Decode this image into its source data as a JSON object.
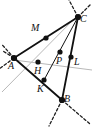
{
  "figure": {
    "type": "geometry-diagram",
    "width": 92,
    "height": 127,
    "background": "#ffffff",
    "colors": {
      "solid_line": "#111111",
      "dashed_line": "#222222",
      "auxiliary_line": "#b8b8b8",
      "point_fill": "#111111",
      "label_text": "#111111"
    },
    "points": [
      {
        "id": "A",
        "label": "A",
        "x": 14,
        "y": 58,
        "r": 3.0,
        "label_x": 10,
        "label_y": 66
      },
      {
        "id": "B",
        "label": "B",
        "x": 62,
        "y": 100,
        "r": 3.0,
        "label_x": 64,
        "label_y": 100
      },
      {
        "id": "C",
        "label": "C",
        "x": 78,
        "y": 17,
        "r": 3.0,
        "label_x": 80,
        "label_y": 19
      },
      {
        "id": "M",
        "label": "M",
        "x": 46,
        "y": 38,
        "r": 2.6,
        "label_x": 33,
        "label_y": 28
      },
      {
        "id": "H",
        "label": "H",
        "x": 38,
        "y": 62,
        "r": 2.6,
        "label_x": 37,
        "label_y": 73
      },
      {
        "id": "K",
        "label": "K",
        "x": 44,
        "y": 80,
        "r": 2.6,
        "label_x": 39,
        "label_y": 92
      },
      {
        "id": "P",
        "label": "P",
        "x": 60,
        "y": 52,
        "r": 2.6,
        "label_x": 57,
        "label_y": 63
      },
      {
        "id": "L",
        "label": "L",
        "x": 71,
        "y": 57,
        "r": 2.6,
        "label_x": 75,
        "label_y": 64
      }
    ],
    "solid_segments": [
      {
        "name": "side-AC",
        "x1": 14,
        "y1": 58,
        "x2": 78,
        "y2": 17,
        "width": 1.6
      },
      {
        "name": "side-AB",
        "x1": 14,
        "y1": 58,
        "x2": 62,
        "y2": 100,
        "width": 1.6
      },
      {
        "name": "side-CB",
        "x1": 78,
        "y1": 17,
        "x2": 62,
        "y2": 100,
        "width": 1.6
      },
      {
        "name": "cevian-C-to-K",
        "x1": 78,
        "y1": 17,
        "x2": 44,
        "y2": 80,
        "width": 1.0
      }
    ],
    "auxiliary_segments": [
      {
        "name": "aux-line-C-to-lower-left",
        "x1": 79,
        "y1": 14,
        "x2": 2,
        "y2": 92,
        "width": 1.0
      },
      {
        "name": "aux-line-A-to-right",
        "x1": 14,
        "y1": 60,
        "x2": 92,
        "y2": 70,
        "width": 1.0
      }
    ],
    "dashed_rays": [
      {
        "name": "dash-A-up-right",
        "x1": 14,
        "y1": 58,
        "x2": 2,
        "y2": 44
      },
      {
        "name": "dash-A-left-down",
        "x1": 14,
        "y1": 58,
        "x2": 1,
        "y2": 68
      },
      {
        "name": "dash-A-up-left",
        "x1": 14,
        "y1": 58,
        "x2": 4,
        "y2": 50
      },
      {
        "name": "dash-C-up-left",
        "x1": 78,
        "y1": 17,
        "x2": 70,
        "y2": 0
      },
      {
        "name": "dash-C-up-right",
        "x1": 78,
        "y1": 17,
        "x2": 91,
        "y2": 5
      },
      {
        "name": "dash-B-down-left",
        "x1": 62,
        "y1": 100,
        "x2": 50,
        "y2": 126
      },
      {
        "name": "dash-B-down-right",
        "x1": 62,
        "y1": 100,
        "x2": 90,
        "y2": 124
      }
    ],
    "labels": [
      "A",
      "B",
      "C",
      "M",
      "H",
      "K",
      "P",
      "L"
    ]
  }
}
